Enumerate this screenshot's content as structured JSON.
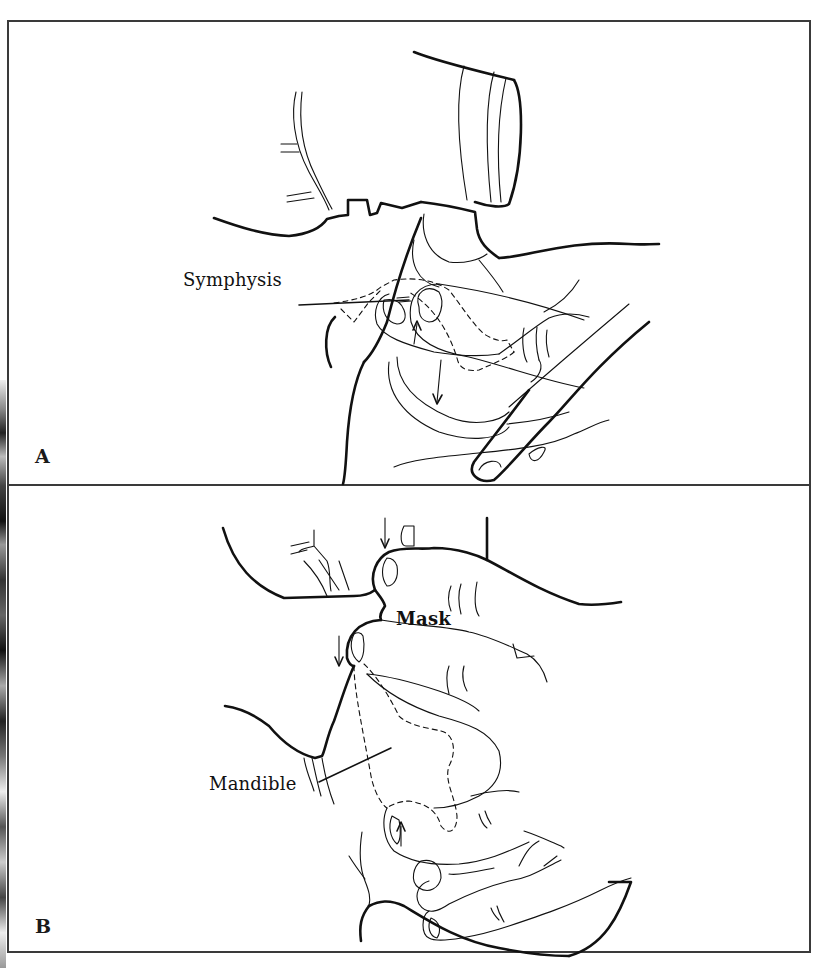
{
  "figure": {
    "panels": [
      {
        "id": "A",
        "label": "A",
        "callouts": [
          {
            "text": "Symphysis",
            "target": "mandible-symphysis"
          }
        ],
        "arrows": [
          {
            "direction": "down",
            "meaning": "thumb pressing mask down"
          },
          {
            "direction": "up",
            "meaning": "finger lifting mandible"
          }
        ],
        "depicts": "Hand holding face mask with thumb on mask and fingers lifting mandible at symphysis"
      },
      {
        "id": "B",
        "label": "B",
        "callouts": [
          {
            "text": "Mask",
            "target": "face-mask"
          },
          {
            "text": "Mandible",
            "target": "mandible"
          }
        ],
        "arrows": [
          {
            "direction": "down",
            "meaning": "upper thumb pressing mask"
          },
          {
            "direction": "down",
            "meaning": "lower thumb pressing mask"
          },
          {
            "direction": "up",
            "meaning": "fingers lifting mandible"
          }
        ],
        "depicts": "Two-handed mask hold with thumbs on mask and fingers lifting mandible"
      }
    ],
    "colors": {
      "ink": "#111111",
      "frame": "#3a3a3a",
      "background": "#ffffff"
    }
  }
}
